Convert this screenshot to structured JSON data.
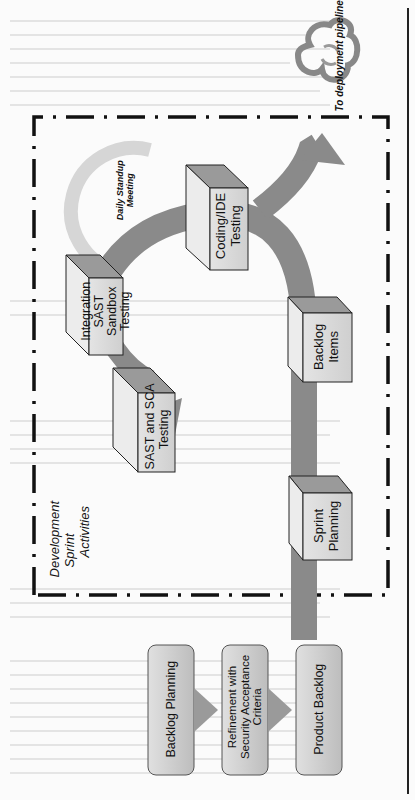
{
  "diagram": {
    "orientation": "rotated 90deg counter-clockwise",
    "container": {
      "label": "Development Sprint Activities",
      "label_lines": [
        "Development",
        "Sprint",
        "Activities"
      ],
      "border": "dash-dot"
    },
    "cloud": {
      "label": "To deployment pipeline",
      "icon": "cloud-sync-icon"
    },
    "loop": {
      "label": "Daily Standup Meeting",
      "label_lines": [
        "Daily Standup",
        "Meeting"
      ]
    },
    "boxes": [
      {
        "id": "sprint-planning",
        "lines": [
          "Sprint",
          "Planning"
        ]
      },
      {
        "id": "backlog-items",
        "lines": [
          "Backlog",
          "Items"
        ]
      },
      {
        "id": "coding-ide-testing",
        "lines": [
          "Coding/IDE",
          "Testing"
        ]
      },
      {
        "id": "integration-sast",
        "lines": [
          "Integration",
          "SAST",
          "Sandbox",
          "Testing"
        ]
      },
      {
        "id": "sast-sca",
        "lines": [
          "SAST and SCA",
          "Testing"
        ]
      }
    ],
    "pipeline": [
      {
        "id": "backlog-planning",
        "label": "Backlog Planning"
      },
      {
        "id": "refinement",
        "lines": [
          "Refinement with",
          "Security Acceptance",
          "Criteria"
        ]
      },
      {
        "id": "product-backlog",
        "label": "Product Backlog"
      }
    ],
    "colors": {
      "arrow": "#8a8a8a",
      "loop": "#d6d6d6",
      "box_front": "#d9d9d9",
      "box_side": "#ececec",
      "box_top": "#9a9a9a",
      "pipeline_fill": "#cfcfcf",
      "border": "#111111"
    }
  }
}
